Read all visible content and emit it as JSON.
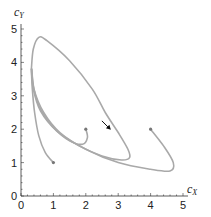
{
  "chart_data": {
    "type": "line",
    "title": "",
    "xlabel": "c_X",
    "ylabel": "c_Y",
    "xlim": [
      0,
      5
    ],
    "ylim": [
      0,
      5
    ],
    "x_ticks": [
      "0",
      "1",
      "2",
      "3",
      "4",
      "5"
    ],
    "y_ticks": [
      "0",
      "1",
      "2",
      "3",
      "4",
      "5"
    ],
    "grid": false,
    "legend": null,
    "line_color": "#a9a9a9",
    "annotations": [
      "arrow indicating direction of trajectory on limit cycle near (2.6, 2.0)"
    ],
    "series": [
      {
        "name": "trajectory from (1,1)",
        "start": [
          1,
          1
        ],
        "points": [
          [
            1,
            1
          ],
          [
            0.75,
            1.3
          ],
          [
            0.55,
            1.8
          ],
          [
            0.42,
            2.5
          ],
          [
            0.35,
            3.2
          ],
          [
            0.32,
            3.8
          ]
        ]
      },
      {
        "name": "trajectory from (2,2)",
        "start": [
          2,
          2
        ],
        "points": [
          [
            2,
            2
          ],
          [
            2.05,
            1.75
          ],
          [
            1.9,
            1.55
          ],
          [
            1.5,
            1.65
          ],
          [
            1.0,
            2.05
          ],
          [
            0.6,
            2.6
          ],
          [
            0.4,
            3.2
          ],
          [
            0.33,
            3.8
          ]
        ]
      },
      {
        "name": "trajectory from (4,2)",
        "start": [
          4,
          2
        ],
        "points": [
          [
            4,
            2
          ],
          [
            4.4,
            1.5
          ],
          [
            4.7,
            1.0
          ],
          [
            4.6,
            0.75
          ],
          [
            4.0,
            0.8
          ],
          [
            3.0,
            1.0
          ],
          [
            2.0,
            1.4
          ],
          [
            1.2,
            1.9
          ],
          [
            0.7,
            2.5
          ],
          [
            0.4,
            3.2
          ],
          [
            0.33,
            3.8
          ]
        ]
      },
      {
        "name": "limit cycle",
        "points": [
          [
            0.32,
            3.8
          ],
          [
            0.38,
            4.4
          ],
          [
            0.55,
            4.75
          ],
          [
            0.8,
            4.65
          ],
          [
            1.5,
            4.05
          ],
          [
            2.2,
            3.2
          ],
          [
            2.6,
            2.5
          ],
          [
            3.0,
            1.9
          ],
          [
            3.3,
            1.4
          ],
          [
            3.35,
            1.15
          ],
          [
            3.1,
            1.08
          ],
          [
            2.5,
            1.2
          ],
          [
            1.8,
            1.5
          ],
          [
            1.1,
            1.95
          ],
          [
            0.6,
            2.55
          ],
          [
            0.38,
            3.2
          ],
          [
            0.32,
            3.8
          ]
        ]
      }
    ],
    "start_markers": [
      [
        1,
        1
      ],
      [
        2,
        2
      ],
      [
        4,
        2
      ]
    ],
    "arrow": {
      "at": [
        2.65,
        2.1
      ],
      "direction": "down-right"
    }
  },
  "axes": {
    "x_label_main": "c",
    "x_label_sub": "X",
    "y_label_main": "c",
    "y_label_sub": "Y",
    "x_tick_labels": [
      "0",
      "1",
      "2",
      "3",
      "4",
      "5"
    ],
    "y_tick_labels": [
      "0",
      "1",
      "2",
      "3",
      "4",
      "5"
    ]
  }
}
